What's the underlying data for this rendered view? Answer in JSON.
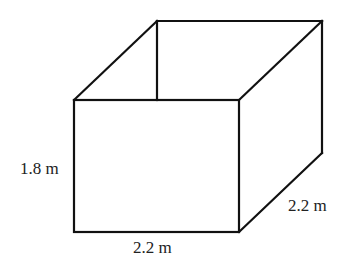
{
  "diagram": {
    "type": "open-box-cuboid",
    "stroke_color": "#111111",
    "background": "#ffffff",
    "labels": {
      "height": "1.8 m",
      "width": "2.2 m",
      "depth": "2.2 m"
    },
    "vertices": {
      "front_top_left": [
        74,
        100
      ],
      "front_top_right": [
        239,
        100
      ],
      "front_bottom_left": [
        74,
        232
      ],
      "front_bottom_right": [
        239,
        232
      ],
      "back_top_left": [
        157,
        21
      ],
      "back_top_right": [
        322,
        21
      ],
      "back_bottom_right": [
        322,
        153
      ]
    }
  }
}
